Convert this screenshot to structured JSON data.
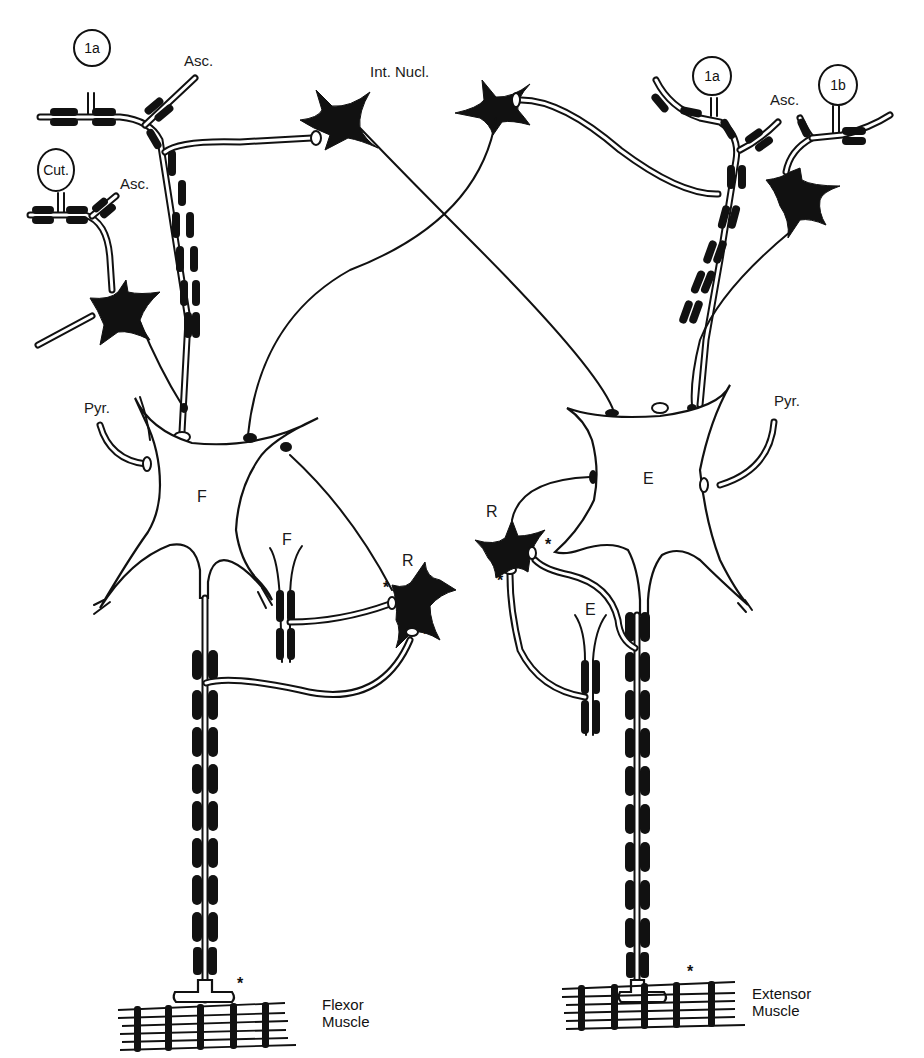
{
  "diagram": {
    "type": "neural-circuit-schematic",
    "colors": {
      "ink": "#111111",
      "background": "#ffffff"
    }
  },
  "labels": {
    "left_1a": "1a",
    "left_asc_1": "Asc.",
    "left_cut": "Cut.",
    "left_asc_2": "Asc.",
    "int_nucl": "Int. Nucl.",
    "right_1a": "1a",
    "right_1b": "1b",
    "right_asc": "Asc.",
    "left_pyr": "Pyr.",
    "right_pyr": "Pyr.",
    "flexor_motoneuron": "F",
    "extensor_motoneuron": "E",
    "left_collateral": "F",
    "right_collateral": "E",
    "left_renshaw": "R",
    "right_renshaw": "R",
    "asterisk": "*"
  },
  "muscles": {
    "flexor": {
      "line1": "Flexor",
      "line2": "Muscle"
    },
    "extensor": {
      "line1": "Extensor",
      "line2": "Muscle"
    }
  },
  "nodes": [
    {
      "id": "flexor-motoneuron",
      "label": "F",
      "kind": "motoneuron"
    },
    {
      "id": "extensor-motoneuron",
      "label": "E",
      "kind": "motoneuron"
    },
    {
      "id": "renshaw-left",
      "label": "R",
      "kind": "renshaw-cell"
    },
    {
      "id": "renshaw-right",
      "label": "R",
      "kind": "renshaw-cell"
    },
    {
      "id": "interneuron-nucleus",
      "label": "Int. Nucl.",
      "kind": "interneuron-pair"
    },
    {
      "id": "afferent-1a-left",
      "label": "1a",
      "kind": "sensory-afferent"
    },
    {
      "id": "afferent-cut",
      "label": "Cut.",
      "kind": "sensory-afferent"
    },
    {
      "id": "afferent-1a-right",
      "label": "1a",
      "kind": "sensory-afferent"
    },
    {
      "id": "afferent-1b-right",
      "label": "1b",
      "kind": "sensory-afferent"
    },
    {
      "id": "flexor-muscle",
      "label": "Flexor Muscle",
      "kind": "muscle"
    },
    {
      "id": "extensor-muscle",
      "label": "Extensor Muscle",
      "kind": "muscle"
    }
  ]
}
